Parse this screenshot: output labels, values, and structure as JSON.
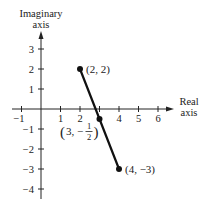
{
  "diagram": {
    "type": "complex-plane-line-segment",
    "x_axis": {
      "title_line1": "Real",
      "title_line2": "axis",
      "ticks": [
        {
          "value": -1,
          "label": "−1"
        },
        {
          "value": 1,
          "label": "1"
        },
        {
          "value": 2,
          "label": "2"
        },
        {
          "value": 3,
          "label": ""
        },
        {
          "value": 4,
          "label": "4"
        },
        {
          "value": 5,
          "label": "5"
        },
        {
          "value": 6,
          "label": "6"
        }
      ]
    },
    "y_axis": {
      "title_line1": "Imaginary",
      "title_line2": "axis",
      "ticks": [
        {
          "value": 3,
          "label": "3"
        },
        {
          "value": 2,
          "label": "2"
        },
        {
          "value": 1,
          "label": "1"
        },
        {
          "value": -1,
          "label": "−1"
        },
        {
          "value": -2,
          "label": "−2"
        },
        {
          "value": -3,
          "label": "−3"
        },
        {
          "value": -4,
          "label": "−4"
        }
      ]
    },
    "points": [
      {
        "x": 2,
        "y": 2,
        "label": "(2, 2)"
      },
      {
        "x": 3,
        "y": -0.5,
        "label_open": "(3, −",
        "label_num": "1",
        "label_den": "2",
        "label_close": ")"
      },
      {
        "x": 4,
        "y": -3,
        "label": "(4, −3)"
      }
    ],
    "segment": {
      "from": [
        2,
        2
      ],
      "to": [
        4,
        -3
      ]
    },
    "colors": {
      "axis": "#222222",
      "segment": "#111111",
      "background": "#ffffff"
    }
  }
}
